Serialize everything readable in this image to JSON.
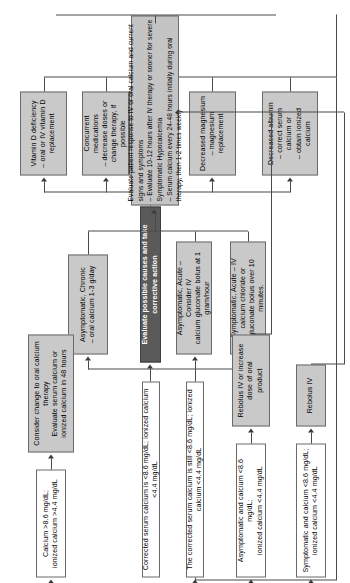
{
  "diagram": {
    "colors": {
      "shade": "#c9c9c9",
      "dark": "#5a5a5a",
      "plain": "#ffffff",
      "line": "#4a4a4a"
    },
    "nodes": {
      "start": "Corrected serum calcium is <8.6 mg/dL; ionized calcium <4.4 mg/dL",
      "evaluate_causes": "Evaluate possible causes and take corrective action",
      "cause_albumin": "Decreased albumin\n– correct serum calcium or\n– obtain ionized calcium",
      "cause_magnesium": "Decreased magnesium\n– magnesium replacement",
      "cause_hypopara": "Hypoparathyroidism\n– IV & oral calcium\n– oral vitamin D",
      "cause_meds": "Concurrent medications\n– decrease doses or\nchange therapy, if possible",
      "cause_vitd": "Vitamin D deficiency\n– oral or IV vitamin D\nreplacement",
      "still_low": "The corrected serum calcium is still <8.6 mg/dL; ionized calcium <4.4 mg/dL",
      "symptomatic_acute": "Symptomatic, Acute – IV calcium chloride or\ngluconate bolus over 10 minutes.",
      "asymptomatic_acute": "Asymptomatic, Acute – Consider IV\ncalcium gluconate bolus at 1 gram/hour",
      "asymptomatic_chronic": "Asymptomatic, Chronic\n– oral calcium 1-3 g/day",
      "evaluate_response": "Evaluate patient response to IV or oral calcium and current signs and symptoms\n– Evaluate 10-12 hours after IV therapy or sooner for severe Symptomatic Hypocalcemia\n– Serum calcium every 24-48 hours initially during oral therapy, then 1-2 times weekly",
      "out_symptomatic": "Symptomatic and calcium <8.6 mg/dL;\nionized calcium <4.4 mg/dL",
      "out_asymptomatic": "Asymptomatic and calcium <8.6 mg/dL;\nionized calcium <4.4 mg/dL",
      "out_normal": "Calcium >8.6 mg/dL;\nionized calcium >4.4 mg/dL",
      "act_rebolus": "Rebolus IV",
      "act_rebolus_increase": "Rebolus IV or increase dose of oral\nproduct",
      "act_change_oral": "Consider change to oral calcium therapy\nEvaluate serum calcium or\nionized calcium in 48 hours"
    }
  }
}
